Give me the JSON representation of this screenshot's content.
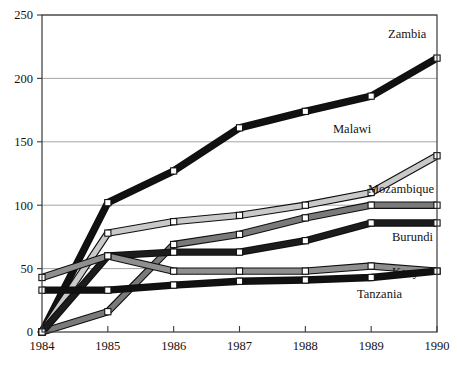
{
  "chart_data": {
    "type": "line",
    "title": "",
    "xlabel": "",
    "ylabel": "",
    "x": [
      1984,
      1985,
      1986,
      1987,
      1988,
      1989,
      1990
    ],
    "xticklabels": [
      "1984",
      "1985",
      "1986",
      "1987",
      "1988",
      "1989",
      "1990"
    ],
    "yticklabels": [
      "0",
      "50",
      "100",
      "150",
      "200",
      "250"
    ],
    "yticks": [
      0,
      50,
      100,
      150,
      200,
      250
    ],
    "ylim": [
      0,
      250
    ],
    "xlim": [
      1984,
      1990
    ],
    "grid": "horizontal",
    "legend": "direct-labels-right",
    "marker": "white-square",
    "series": [
      {
        "name": "Zambia",
        "label": "Zambia",
        "color": "#111111",
        "values": [
          0,
          102,
          127,
          161,
          174,
          186,
          216
        ],
        "label_y": 216
      },
      {
        "name": "Malawi",
        "label": "Malawi",
        "color": "#c9c9c9",
        "values": [
          0,
          78,
          87,
          92,
          100,
          110,
          139
        ],
        "label_y": 139
      },
      {
        "name": "Mozambique",
        "label": "Mozambique",
        "color": "#7a7a7a",
        "values": [
          0,
          16,
          69,
          77,
          90,
          100,
          100
        ],
        "label_y": 100
      },
      {
        "name": "Burundi",
        "label": "Burundi",
        "color": "#1c1c1c",
        "values": [
          0,
          60,
          63,
          63,
          72,
          86,
          86
        ],
        "label_y": 86
      },
      {
        "name": "Kenya",
        "label": "Kenya",
        "color": "#8f8f8f",
        "values": [
          43,
          60,
          48,
          48,
          48,
          52,
          48
        ],
        "label_y": 52
      },
      {
        "name": "Tanzania",
        "label": "Tanzania",
        "color": "#111111",
        "values": [
          33,
          33,
          37,
          40,
          41,
          43,
          48
        ],
        "label_y": 43
      }
    ]
  },
  "axes": {
    "frame_color": "#3a3a3a",
    "grid_color": "#9a9a9a"
  }
}
